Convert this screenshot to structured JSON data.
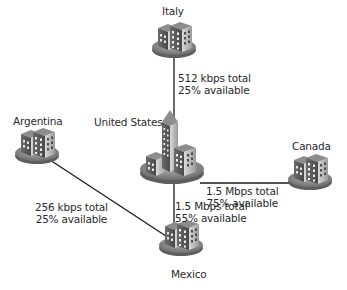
{
  "diagram": {
    "type": "network-topology",
    "nodes": [
      {
        "id": "italy",
        "label": "Italy"
      },
      {
        "id": "us",
        "label": "United States"
      },
      {
        "id": "canada",
        "label": "Canada"
      },
      {
        "id": "argentina",
        "label": "Argentina"
      },
      {
        "id": "mexico",
        "label": "Mexico"
      }
    ],
    "links": [
      {
        "from": "italy",
        "to": "us",
        "total": "512 kbps total",
        "available": "25% available"
      },
      {
        "from": "us",
        "to": "canada",
        "total": "1.5 Mbps total",
        "available": "75% available"
      },
      {
        "from": "us",
        "to": "mexico",
        "total": "1.5 Mbps total",
        "available": "55% available"
      },
      {
        "from": "argentina",
        "to": "mexico",
        "total": "256 kbps total",
        "available": "25% available"
      }
    ],
    "colors": {
      "line": "#1a1a1a",
      "disc_top": "#8a8a8a",
      "building_dark": "#5a5a5a",
      "building_light": "#c8c8c8",
      "text": "#2a2a2a"
    }
  }
}
